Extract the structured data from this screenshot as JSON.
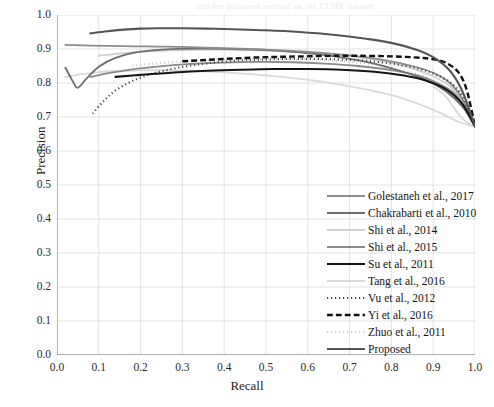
{
  "figure": {
    "ghost_text_above": "and the proposed method on the CUHK dataset"
  },
  "axes": {
    "xlabel": "Recall",
    "ylabel": "Precision",
    "xticks": [
      "0.0",
      "0.1",
      "0.2",
      "0.3",
      "0.4",
      "0.5",
      "0.6",
      "0.7",
      "0.8",
      "0.9",
      "1.0"
    ],
    "yticks": [
      "0.0",
      "0.1",
      "0.2",
      "0.3",
      "0.4",
      "0.5",
      "0.6",
      "0.7",
      "0.8",
      "0.9",
      "1.0"
    ],
    "xlim": [
      0.0,
      1.0
    ],
    "ylim": [
      0.0,
      1.0
    ],
    "grid": true
  },
  "legend": {
    "position": "lower-right-inside",
    "entries": [
      {
        "label": "Golestaneh et al., 2017",
        "color": "#8c8c8c",
        "style": "solid",
        "width": 1.8
      },
      {
        "label": "Chakrabarti et al., 2010",
        "color": "#6e6e6e",
        "style": "solid",
        "width": 1.8
      },
      {
        "label": "Shi et al., 2014",
        "color": "#cfcfcf",
        "style": "solid",
        "width": 1.8
      },
      {
        "label": "Shi et al., 2015",
        "color": "#8a8a8a",
        "style": "solid",
        "width": 1.8
      },
      {
        "label": "Su et al., 2011",
        "color": "#151515",
        "style": "solid",
        "width": 2.1
      },
      {
        "label": "Tang et al., 2016",
        "color": "#d9d9d9",
        "style": "solid",
        "width": 1.8
      },
      {
        "label": "Vu et al., 2012",
        "color": "#4a4a4a",
        "style": "dotted",
        "width": 2.2
      },
      {
        "label": "Yi et al., 2016",
        "color": "#111111",
        "style": "dashed",
        "width": 2.4
      },
      {
        "label": "Zhuo et al., 2011",
        "color": "#d0d0d0",
        "style": "dotted",
        "width": 2.2
      },
      {
        "label": "Proposed",
        "color": "#555555",
        "style": "solid",
        "width": 2.1
      }
    ]
  },
  "chart_data": {
    "type": "line",
    "title": "",
    "xlabel": "Recall",
    "ylabel": "Precision",
    "xlim": [
      0.0,
      1.0
    ],
    "ylim": [
      0.0,
      1.0
    ],
    "grid": true,
    "legend_position": "lower-right-inside",
    "series": [
      {
        "name": "Proposed",
        "color": "#555555",
        "style": "solid",
        "x": [
          0.08,
          0.12,
          0.16,
          0.2,
          0.24,
          0.3,
          0.36,
          0.42,
          0.5,
          0.58,
          0.66,
          0.74,
          0.8,
          0.86,
          0.9,
          0.94,
          0.97,
          1.0
        ],
        "y": [
          0.946,
          0.952,
          0.957,
          0.96,
          0.961,
          0.961,
          0.96,
          0.958,
          0.955,
          0.95,
          0.942,
          0.93,
          0.918,
          0.898,
          0.876,
          0.836,
          0.775,
          0.672
        ]
      },
      {
        "name": "Golestaneh et al., 2017",
        "color": "#8c8c8c",
        "style": "solid",
        "x": [
          0.02,
          0.05,
          0.08,
          0.12,
          0.18,
          0.24,
          0.3,
          0.38,
          0.46,
          0.54,
          0.62,
          0.7,
          0.78,
          0.85,
          0.9,
          0.94,
          0.97,
          1.0
        ],
        "y": [
          0.912,
          0.911,
          0.91,
          0.909,
          0.908,
          0.907,
          0.906,
          0.903,
          0.9,
          0.896,
          0.89,
          0.881,
          0.868,
          0.85,
          0.83,
          0.8,
          0.752,
          0.672
        ]
      },
      {
        "name": "Chakrabarti et al., 2010",
        "color": "#6e6e6e",
        "style": "solid",
        "x": [
          0.02,
          0.04,
          0.05,
          0.07,
          0.1,
          0.14,
          0.2,
          0.26,
          0.34,
          0.42,
          0.5,
          0.58,
          0.66,
          0.74,
          0.82,
          0.88,
          0.93,
          0.97,
          1.0
        ],
        "y": [
          0.845,
          0.8,
          0.786,
          0.812,
          0.848,
          0.874,
          0.892,
          0.899,
          0.901,
          0.9,
          0.897,
          0.89,
          0.879,
          0.862,
          0.836,
          0.81,
          0.776,
          0.73,
          0.672
        ]
      },
      {
        "name": "Shi et al., 2014",
        "color": "#cfcfcf",
        "style": "solid",
        "x": [
          0.1,
          0.16,
          0.22,
          0.3,
          0.38,
          0.46,
          0.54,
          0.62,
          0.7,
          0.78,
          0.84,
          0.9,
          0.94,
          0.97,
          1.0
        ],
        "y": [
          0.88,
          0.888,
          0.893,
          0.897,
          0.898,
          0.897,
          0.894,
          0.888,
          0.879,
          0.864,
          0.847,
          0.82,
          0.79,
          0.745,
          0.672
        ]
      },
      {
        "name": "Shi et al., 2015",
        "color": "#8a8a8a",
        "style": "solid",
        "x": [
          0.08,
          0.12,
          0.18,
          0.24,
          0.32,
          0.4,
          0.48,
          0.56,
          0.64,
          0.72,
          0.8,
          0.86,
          0.91,
          0.95,
          0.98,
          1.0
        ],
        "y": [
          0.818,
          0.828,
          0.84,
          0.848,
          0.856,
          0.86,
          0.862,
          0.861,
          0.857,
          0.85,
          0.838,
          0.823,
          0.8,
          0.77,
          0.72,
          0.672
        ]
      },
      {
        "name": "Su et al., 2011",
        "color": "#151515",
        "style": "solid",
        "x": [
          0.14,
          0.2,
          0.28,
          0.36,
          0.44,
          0.52,
          0.6,
          0.68,
          0.76,
          0.83,
          0.88,
          0.93,
          0.97,
          1.0
        ],
        "y": [
          0.818,
          0.824,
          0.831,
          0.836,
          0.839,
          0.841,
          0.841,
          0.839,
          0.833,
          0.822,
          0.808,
          0.782,
          0.738,
          0.672
        ]
      },
      {
        "name": "Tang et al., 2016",
        "color": "#d9d9d9",
        "style": "solid",
        "x": [
          0.02,
          0.06,
          0.1,
          0.16,
          0.24,
          0.32,
          0.42,
          0.52,
          0.62,
          0.72,
          0.8,
          0.87,
          0.92,
          0.96,
          1.0
        ],
        "y": [
          0.818,
          0.826,
          0.832,
          0.836,
          0.838,
          0.836,
          0.83,
          0.82,
          0.806,
          0.786,
          0.764,
          0.736,
          0.71,
          0.686,
          0.672
        ]
      },
      {
        "name": "Vu et al., 2012",
        "color": "#4a4a4a",
        "style": "dotted",
        "x": [
          0.085,
          0.11,
          0.14,
          0.18,
          0.23,
          0.29,
          0.36,
          0.44,
          0.52,
          0.6,
          0.68,
          0.76,
          0.83,
          0.89,
          0.94,
          0.97,
          1.0
        ],
        "y": [
          0.71,
          0.745,
          0.778,
          0.806,
          0.828,
          0.845,
          0.858,
          0.866,
          0.87,
          0.871,
          0.869,
          0.863,
          0.851,
          0.833,
          0.802,
          0.76,
          0.672
        ]
      },
      {
        "name": "Yi et al., 2016",
        "color": "#111111",
        "style": "dashed",
        "x": [
          0.3,
          0.36,
          0.42,
          0.5,
          0.58,
          0.66,
          0.72,
          0.78,
          0.83,
          0.87,
          0.9,
          0.93,
          0.96,
          0.98,
          1.0
        ],
        "y": [
          0.864,
          0.868,
          0.872,
          0.876,
          0.878,
          0.88,
          0.88,
          0.879,
          0.877,
          0.874,
          0.87,
          0.86,
          0.832,
          0.78,
          0.672
        ]
      },
      {
        "name": "Zhuo et al., 2011",
        "color": "#d0d0d0",
        "style": "dotted",
        "x": [
          0.18,
          0.24,
          0.32,
          0.4,
          0.48,
          0.56,
          0.64,
          0.72,
          0.78,
          0.84,
          0.88,
          0.92,
          0.95,
          0.98,
          1.0
        ],
        "y": [
          0.852,
          0.858,
          0.864,
          0.868,
          0.87,
          0.87,
          0.867,
          0.86,
          0.85,
          0.834,
          0.818,
          0.792,
          0.76,
          0.716,
          0.672
        ]
      },
      {
        "name": "Chakrabarti-low-tail",
        "color": "#d9d9d9",
        "style": "solid",
        "x": [
          0.9,
          0.93,
          0.955,
          0.975,
          1.0
        ],
        "y": [
          0.79,
          0.76,
          0.718,
          0.69,
          0.672
        ]
      }
    ]
  }
}
